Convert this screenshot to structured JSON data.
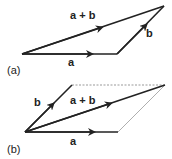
{
  "diagram": {
    "colors": {
      "stroke": "#222222",
      "dashed": "#999999",
      "background": "#ffffff"
    },
    "panels": [
      {
        "id": "a",
        "caption": "(a)",
        "method": "triangle",
        "labels": {
          "a": "a",
          "b": "b",
          "sum": "a + b"
        }
      },
      {
        "id": "b",
        "caption": "(b)",
        "method": "parallelogram",
        "labels": {
          "a": "a",
          "b": "b",
          "sum": "a + b"
        }
      }
    ]
  }
}
